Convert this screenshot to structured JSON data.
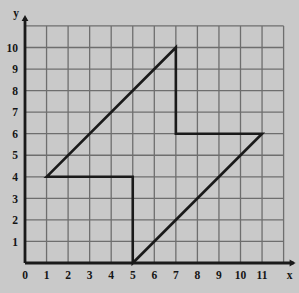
{
  "figure": {
    "type": "coordinate-grid-polygon",
    "background_color": "#c9c9c9",
    "grid_color": "#6e6e6e",
    "grid_minor_color": "#8a8a8a",
    "axis_color": "#1a1a1a",
    "shape_color": "#1a1a1a"
  },
  "axes": {
    "x_label": "x",
    "y_label": "y",
    "x_ticks": [
      "0",
      "1",
      "2",
      "3",
      "4",
      "5",
      "6",
      "7",
      "8",
      "9",
      "10",
      "11"
    ],
    "y_ticks": [
      "0",
      "1",
      "2",
      "3",
      "4",
      "5",
      "6",
      "7",
      "8",
      "9",
      "10"
    ],
    "x_min": 0,
    "x_max": 12,
    "y_min": 0,
    "y_max": 11,
    "x_arrow": true,
    "y_arrow": true
  },
  "chart_data": {
    "type": "line",
    "title": "",
    "xlabel": "x",
    "ylabel": "y",
    "xlim": [
      0,
      12
    ],
    "ylim": [
      0,
      11
    ],
    "grid": true,
    "legend": "none",
    "series": [
      {
        "name": "polygon",
        "closed": true,
        "points": [
          [
            1,
            4
          ],
          [
            7,
            10
          ],
          [
            7,
            6
          ],
          [
            11,
            6
          ],
          [
            5,
            0
          ],
          [
            5,
            4
          ],
          [
            1,
            4
          ]
        ]
      }
    ],
    "vertices_labels": [
      "(1, 4)",
      "(7, 10)",
      "(7, 6)",
      "(11, 6)",
      "(5, 0)",
      "(5, 4)"
    ]
  }
}
